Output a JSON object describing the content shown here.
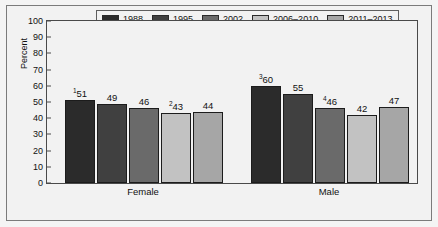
{
  "chart_data": {
    "type": "bar",
    "title": "",
    "xlabel": "",
    "ylabel": "Percent",
    "ylim": [
      0,
      100
    ],
    "ytick_step": 10,
    "yticks": [
      100,
      90,
      80,
      70,
      60,
      50,
      40,
      30,
      20,
      10,
      0
    ],
    "grid": false,
    "legend_position": "top",
    "categories": [
      "Female",
      "Male"
    ],
    "series": [
      {
        "name": "1988",
        "color": "#2b2b2b",
        "values": [
          51,
          60
        ],
        "labels": [
          "51",
          "60"
        ],
        "footnotes": [
          "1",
          "3"
        ]
      },
      {
        "name": "1995",
        "color": "#404040",
        "values": [
          49,
          55
        ],
        "labels": [
          "49",
          "55"
        ],
        "footnotes": [
          "",
          ""
        ]
      },
      {
        "name": "2002",
        "color": "#6a6a6a",
        "values": [
          46,
          46
        ],
        "labels": [
          "46",
          "46"
        ],
        "footnotes": [
          "",
          "4"
        ]
      },
      {
        "name": "2006–2010",
        "color": "#c2c2c2",
        "values": [
          43,
          42
        ],
        "labels": [
          "43",
          "42"
        ],
        "footnotes": [
          "2",
          ""
        ]
      },
      {
        "name": "2011–2013",
        "color": "#a6a6a6",
        "values": [
          44,
          47
        ],
        "labels": [
          "44",
          "47"
        ],
        "footnotes": [
          "",
          ""
        ]
      }
    ]
  },
  "legend": {
    "items": [
      {
        "label": "1988",
        "color": "#2b2b2b"
      },
      {
        "label": "1995",
        "color": "#404040"
      },
      {
        "label": "2002",
        "color": "#6a6a6a"
      },
      {
        "label": "2006–2010",
        "color": "#c2c2c2"
      },
      {
        "label": "2011–2013",
        "color": "#a6a6a6"
      }
    ]
  },
  "axis": {
    "y_title": "Percent",
    "y_labels": [
      "100",
      "90",
      "80",
      "70",
      "60",
      "50",
      "40",
      "30",
      "20",
      "10",
      "0"
    ]
  },
  "groups": [
    {
      "label": "Female"
    },
    {
      "label": "Male"
    }
  ]
}
